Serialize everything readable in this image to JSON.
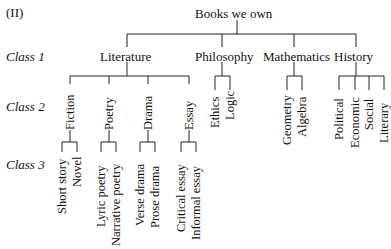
{
  "figure_label": "(II)",
  "root": "Books we own",
  "class_labels": [
    "Class 1",
    "Class 2",
    "Class 3"
  ],
  "class1": [
    "Literature",
    "Philosophy",
    "Mathematics",
    "History"
  ],
  "class2": {
    "literature": [
      "Fiction",
      "Poetry",
      "Drama",
      "Essay"
    ],
    "philosophy": [
      "Ethics",
      "Logic"
    ],
    "mathematics": [
      "Geometry",
      "Algebra"
    ],
    "history": [
      "Political",
      "Economic",
      "Social",
      "Literary"
    ]
  },
  "class3": {
    "fiction": [
      "Short story",
      "Novel"
    ],
    "poetry": [
      "Lyric poetry",
      "Narrative poetry"
    ],
    "drama": [
      "Verse drama",
      "Prose drama"
    ],
    "essay": [
      "Critical essay",
      "Informal essay"
    ]
  }
}
